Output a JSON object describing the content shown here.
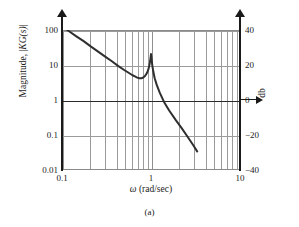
{
  "figure": {
    "caption": "(a)",
    "x_axis_title_symbol": "ω",
    "x_axis_title_rest": " (rad/sec)",
    "y_axis_title_prefix": "Magnitude, |",
    "y_axis_title_italic": "KG(s)",
    "y_axis_title_suffix": "|",
    "right_axis_title": "db"
  },
  "chart_data": {
    "type": "line",
    "title": "",
    "subtitle": "",
    "xlabel": "ω (rad/sec)",
    "ylabel": "Magnitude, |KG(s)|",
    "ylabel_right": "db",
    "xscale": "log",
    "yscale": "log",
    "xlim": [
      0.1,
      10
    ],
    "ylim": [
      0.01,
      100
    ],
    "ylim_right_db": [
      -40,
      40
    ],
    "grid": true,
    "grid_minor": true,
    "legend": "none",
    "xticks": [
      0.1,
      1,
      10
    ],
    "xticklabels": [
      "0.1",
      "1",
      "10"
    ],
    "yticks": [
      0.01,
      0.1,
      1,
      10,
      100
    ],
    "yticklabels": [
      "0.01",
      "0.1",
      "1",
      "10",
      "100"
    ],
    "yticks_right_db": [
      -40,
      -20,
      0,
      20,
      40
    ],
    "yticklabels_right": [
      "-40",
      "-20",
      "0",
      "20",
      "40"
    ],
    "highlighted_gridline": {
      "y": 1,
      "db": 0,
      "style": "dark"
    },
    "series": [
      {
        "name": "|KG(jw)|",
        "x": [
          0.1,
          0.12,
          0.145,
          0.175,
          0.21,
          0.25,
          0.3,
          0.36,
          0.43,
          0.5,
          0.56,
          0.62,
          0.66,
          0.7,
          0.74,
          0.78,
          0.82,
          0.86,
          0.9,
          0.93,
          0.955,
          0.97,
          0.985,
          0.995,
          1.0,
          1.008,
          1.018,
          1.035,
          1.06,
          1.1,
          1.16,
          1.25,
          1.4,
          1.6,
          1.9,
          2.2,
          2.6,
          3.0,
          3.3
        ],
        "y": [
          130.0,
          92.0,
          66.0,
          48.0,
          34.0,
          25.0,
          18.0,
          13.0,
          9.3,
          7.2,
          6.0,
          5.1,
          4.7,
          4.35,
          4.2,
          4.2,
          4.4,
          4.9,
          5.9,
          7.2,
          9.4,
          11.5,
          15.0,
          18.5,
          20.5,
          18.0,
          14.0,
          9.6,
          6.6,
          4.2,
          2.7,
          1.65,
          0.88,
          0.5,
          0.265,
          0.16,
          0.086,
          0.05,
          0.034
        ]
      }
    ],
    "annotations": [
      {
        "text": "resonant peak",
        "x": 1.0,
        "y": 20.5
      },
      {
        "text": "local minimum",
        "x": 0.75,
        "y": 4.2
      }
    ]
  },
  "grid_lines": {
    "x_decades": [
      0.1,
      1,
      10
    ],
    "x_minor_multipliers": [
      2,
      3,
      4,
      5,
      6,
      7,
      8,
      9
    ],
    "y_decades": [
      0.01,
      0.1,
      1,
      10,
      100
    ]
  }
}
